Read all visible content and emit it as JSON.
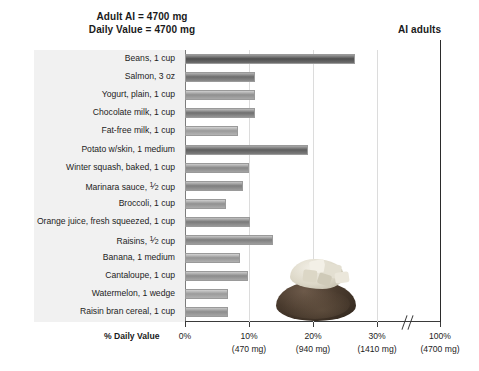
{
  "header": {
    "line1": "Adult AI = 4700 mg",
    "line2": "Daily Value = 4700 mg",
    "ai_adults": "AI adults"
  },
  "axis": {
    "title": "% Daily Value",
    "ticks": [
      {
        "label": "0%",
        "sub": ""
      },
      {
        "label": "10%",
        "sub": "(470 mg)"
      },
      {
        "label": "20%",
        "sub": "(940 mg)"
      },
      {
        "label": "30%",
        "sub": "(1410 mg)"
      },
      {
        "label": "100%",
        "sub": "(4700 mg)"
      }
    ]
  },
  "chart_data": {
    "type": "bar",
    "orientation": "horizontal",
    "xlabel": "% Daily Value",
    "ylabel": "",
    "xlim": [
      0,
      30
    ],
    "axis_break": true,
    "axis_break_after": 30,
    "reference_line": {
      "label": "AI adults",
      "value": 100
    },
    "grid": true,
    "gridlines_at": [
      10,
      20,
      30
    ],
    "xtick_values": [
      0,
      10,
      20,
      30,
      100
    ],
    "xtick_labels": [
      "0%",
      "10%",
      "20%",
      "30%",
      "100%"
    ],
    "xtick_sublabels": [
      "",
      "(470 mg)",
      "(940 mg)",
      "(1410 mg)",
      "(4700 mg)"
    ],
    "categories": [
      "Beans, 1 cup",
      "Salmon, 3 oz",
      "Yogurt, plain, 1 cup",
      "Chocolate milk, 1 cup",
      "Fat-free milk, 1 cup",
      "Potato w/skin, 1 medium",
      "Winter squash, baked, 1 cup",
      "Marinara sauce, ½ cup",
      "Broccoli, 1 cup",
      "Orange juice,  fresh squeezed, 1 cup",
      "Raisins, ½ cup",
      "Banana, 1 medium",
      "Cantaloupe, 1 cup",
      "Watermelon, 1 wedge",
      "Raisin bran cereal, 1 cup"
    ],
    "values": [
      26.5,
      11.0,
      11.0,
      11.0,
      8.3,
      19.2,
      10.0,
      9.1,
      6.4,
      10.2,
      13.8,
      8.6,
      9.8,
      6.7,
      6.7
    ],
    "units": "% Daily Value"
  },
  "labels": [
    {
      "pre": "Beans, 1 cup",
      "frac": "",
      "post": ""
    },
    {
      "pre": "Salmon, 3 oz",
      "frac": "",
      "post": ""
    },
    {
      "pre": "Yogurt, plain, 1 cup",
      "frac": "",
      "post": ""
    },
    {
      "pre": "Chocolate milk, 1 cup",
      "frac": "",
      "post": ""
    },
    {
      "pre": "Fat-free milk, 1 cup",
      "frac": "",
      "post": ""
    },
    {
      "pre": "Potato w/skin, 1 medium",
      "frac": "",
      "post": ""
    },
    {
      "pre": "Winter squash, baked, 1 cup",
      "frac": "",
      "post": ""
    },
    {
      "pre": "Marinara sauce, ",
      "frac": "1/2",
      "post": " cup"
    },
    {
      "pre": "Broccoli, 1 cup",
      "frac": "",
      "post": ""
    },
    {
      "pre": "Orange juice,  fresh squeezed, 1 cup",
      "frac": "",
      "post": ""
    },
    {
      "pre": "Raisins, ",
      "frac": "1/2",
      "post": " cup"
    },
    {
      "pre": "Banana, 1 medium",
      "frac": "",
      "post": ""
    },
    {
      "pre": "Cantaloupe, 1 cup",
      "frac": "",
      "post": ""
    },
    {
      "pre": "Watermelon, 1 wedge",
      "frac": "",
      "post": ""
    },
    {
      "pre": "Raisin bran cereal, 1 cup",
      "frac": "",
      "post": ""
    }
  ],
  "style": {
    "bar_gradients": [
      [
        "#9b9b9b",
        "#4f4f4f",
        "#6e6e6e"
      ],
      [
        "#b3b3b3",
        "#6d6d6d",
        "#8a8a8a"
      ],
      [
        "#cfcfcf",
        "#8f8f8f",
        "#a8a8a8"
      ],
      [
        "#bdbdbd",
        "#6f6f6f",
        "#949494"
      ],
      [
        "#d2d2d2",
        "#9a9a9a",
        "#b4b4b4"
      ],
      [
        "#aaaaaa",
        "#5e5e5e",
        "#7d7d7d"
      ],
      [
        "#cccccc",
        "#878787",
        "#a3a3a3"
      ],
      [
        "#c4c4c4",
        "#7e7e7e",
        "#9a9a9a"
      ],
      [
        "#cfcfcf",
        "#909090",
        "#ababab"
      ],
      [
        "#c2c2c2",
        "#7a7a7a",
        "#989898"
      ],
      [
        "#c8c8c8",
        "#7e7e7e",
        "#9d9d9d"
      ],
      [
        "#d4d4d4",
        "#949494",
        "#b0b0b0"
      ],
      [
        "#cbcbcb",
        "#8b8b8b",
        "#a6a6a6"
      ],
      [
        "#d0d0d0",
        "#9b9b9b",
        "#b2b2b2"
      ],
      [
        "#c6c6c6",
        "#8d8d8d",
        "#a5a5a5"
      ]
    ],
    "panel_bg": "#f1f1f1",
    "grid_color": "#dcdcdc",
    "axis_color": "#3a3a3a"
  },
  "potato_image": {
    "alt": "baked potato with topping"
  }
}
